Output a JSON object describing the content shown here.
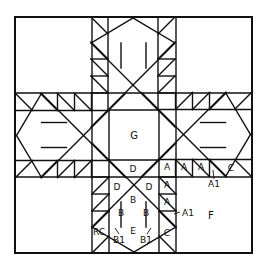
{
  "diagram": {
    "line_color": "#111111",
    "background": "#ffffff",
    "labels": {
      "center": "G",
      "corner": "F",
      "D_top": "D",
      "D_left": "D",
      "D_right": "D",
      "B_top": "B",
      "B_left": "B",
      "B_right": "B",
      "E": "E",
      "RC": "RC",
      "B1_left": "B1",
      "B1_right": "B1",
      "C_bottom": "C",
      "C_right": "C",
      "A_1": "A",
      "A_2": "A",
      "A_3": "A",
      "A_4": "A",
      "A_5": "A",
      "A1_right": "A1",
      "A1_bottom": "A1"
    }
  }
}
